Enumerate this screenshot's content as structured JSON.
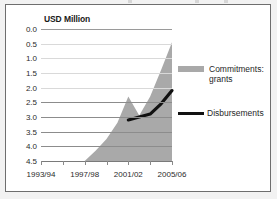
{
  "figure": {
    "title": "USD Million",
    "frame_color": "#6e6e6e",
    "background": "#f2f2f2"
  },
  "legend": {
    "position": "right",
    "entries": [
      {
        "label": "Commitments:\ngrants",
        "type": "area",
        "color": "#a9a9a9"
      },
      {
        "label": "Disbursements",
        "type": "line",
        "color": "#111111"
      }
    ]
  },
  "axis": {
    "y_ticks": [
      "4.5",
      "4.0",
      "3.5",
      "3.0",
      "2.5",
      "2.0",
      "1.5",
      "1.0",
      "0.5",
      "0.0"
    ],
    "x_ticks": [
      "1993/94",
      "1997/98",
      "2001/02",
      "2005/06"
    ]
  },
  "chart_data": {
    "type": "area",
    "title": "USD Million",
    "xlabel": "",
    "ylabel": "USD Million",
    "ylim": [
      0.0,
      4.5
    ],
    "ytick_values": [
      0.0,
      0.5,
      1.0,
      1.5,
      2.0,
      2.5,
      3.0,
      3.5,
      4.0,
      4.5
    ],
    "grid": true,
    "legend_position": "right",
    "categories": [
      "1993/94",
      "1994/95",
      "1995/96",
      "1996/97",
      "1997/98",
      "1998/99",
      "1999/00",
      "2000/01",
      "2001/02",
      "2002/03",
      "2003/04",
      "2004/05",
      "2005/06"
    ],
    "x_tick_labels": [
      "1993/94",
      "1997/98",
      "2001/02",
      "2005/06"
    ],
    "series": [
      {
        "name": "Commitments: grants",
        "type": "area",
        "color": "#a9a9a9",
        "values": [
          0.0,
          0.0,
          0.0,
          0.0,
          0.0,
          0.35,
          0.75,
          1.3,
          2.2,
          1.55,
          2.2,
          3.1,
          4.05
        ]
      },
      {
        "name": "Disbursements",
        "type": "line",
        "color": "#111111",
        "values": [
          null,
          null,
          null,
          null,
          null,
          null,
          null,
          null,
          1.4,
          1.5,
          1.6,
          1.95,
          2.4
        ]
      }
    ]
  }
}
